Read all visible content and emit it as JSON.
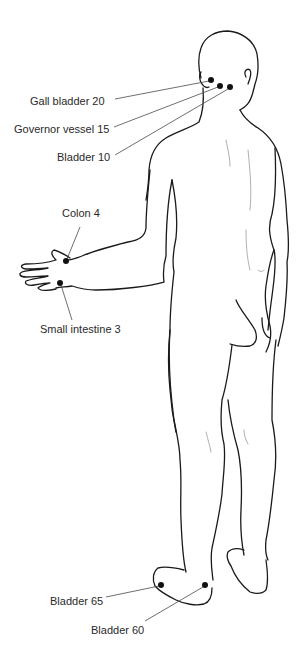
{
  "diagram": {
    "colors": {
      "outline": "#1a1a1a",
      "point": "#111111",
      "leader": "#4a4a4a",
      "label": "#2a2a2a",
      "background": "#ffffff"
    },
    "points": [
      {
        "id": "gall-bladder-20",
        "label": "Gall bladder 20",
        "dot": [
          211,
          80
        ],
        "label_anchor": [
          113,
          101
        ]
      },
      {
        "id": "governor-vessel-15",
        "label": "Governor vessel 15",
        "dot": [
          220,
          86
        ],
        "label_anchor": [
          111,
          129
        ]
      },
      {
        "id": "bladder-10",
        "label": "Bladder 10",
        "dot": [
          230,
          87
        ],
        "label_anchor": [
          113,
          157
        ]
      },
      {
        "id": "colon-4",
        "label": "Colon 4",
        "dot": [
          66,
          261
        ],
        "label_anchor": [
          80,
          219
        ]
      },
      {
        "id": "small-intestine-3",
        "label": "Small intestine 3",
        "dot": [
          60,
          283
        ],
        "label_anchor": [
          72,
          328
        ]
      },
      {
        "id": "bladder-65",
        "label": "Bladder 65",
        "dot": [
          161,
          585
        ],
        "label_anchor": [
          104,
          601
        ]
      },
      {
        "id": "bladder-60",
        "label": "Bladder 60",
        "dot": [
          205,
          585
        ],
        "label_anchor": [
          143,
          625
        ]
      }
    ]
  }
}
